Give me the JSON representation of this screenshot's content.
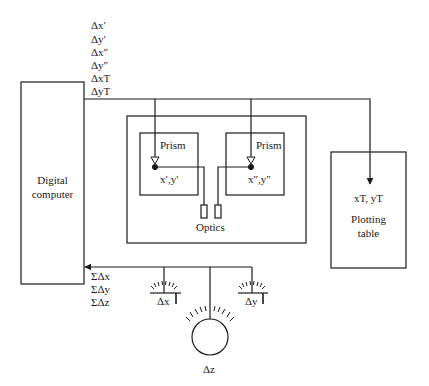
{
  "diagram": {
    "type": "analytical plotter block diagram",
    "output_labels": [
      "Δx′",
      "Δy′",
      "Δx″",
      "Δy″",
      "ΔxT",
      "ΔyT"
    ],
    "input_labels": [
      "ΣΔx",
      "ΣΔy",
      "ΣΔz"
    ],
    "computer": {
      "line1": "Digital",
      "line2": "computer"
    },
    "left_prism": {
      "title": "Prism",
      "coords": "x′,y′"
    },
    "right_prism": {
      "title": "Prism",
      "coords": "x″,y″"
    },
    "optics_label": "Optics",
    "plotting_table": {
      "coords": "xT, yT",
      "line1": "Plotting",
      "line2": "table"
    },
    "handwheels": [
      {
        "id": "dx",
        "label": "Δx"
      },
      {
        "id": "dy",
        "label": "Δy"
      },
      {
        "id": "dz",
        "label": "Δz"
      }
    ],
    "colors": {
      "line": "#1a1a1a",
      "background": "#ffffff"
    }
  }
}
